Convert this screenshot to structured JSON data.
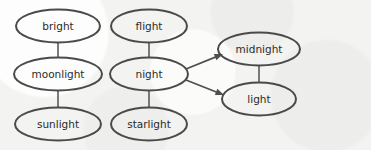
{
  "diagram": {
    "style": {
      "background_color": "#f3f3f1",
      "node_stroke_color": "#4a4a4a",
      "edge_color": "#5a5a5a",
      "arrow_color": "#4f4f4f",
      "label_color": "#2b2b2b"
    },
    "nodes": [
      {
        "id": "bright",
        "label": "bright",
        "cx": 58,
        "cy": 26,
        "rx": 42,
        "ry": 16.5,
        "column": "left"
      },
      {
        "id": "moonlight",
        "label": "moonlight",
        "cx": 58,
        "cy": 74,
        "rx": 44,
        "ry": 16.5,
        "column": "left"
      },
      {
        "id": "sunlight",
        "label": "sunlight",
        "cx": 58,
        "cy": 124,
        "rx": 43,
        "ry": 16.5,
        "column": "left"
      },
      {
        "id": "flight",
        "label": "flight",
        "cx": 149,
        "cy": 26,
        "rx": 38,
        "ry": 16.5,
        "column": "middle"
      },
      {
        "id": "night",
        "label": "night",
        "cx": 149,
        "cy": 74,
        "rx": 39,
        "ry": 16.5,
        "column": "middle"
      },
      {
        "id": "starlight",
        "label": "starlight",
        "cx": 149,
        "cy": 124,
        "rx": 38,
        "ry": 16.5,
        "column": "middle"
      },
      {
        "id": "midnight",
        "label": "midnight",
        "cx": 259,
        "cy": 49,
        "rx": 41,
        "ry": 16.5,
        "column": "right"
      },
      {
        "id": "light",
        "label": "light",
        "cx": 259,
        "cy": 99,
        "rx": 37,
        "ry": 16.5,
        "column": "right"
      }
    ],
    "edges": [
      {
        "id": "bright-moonlight",
        "from": "bright",
        "to": "moonlight",
        "type": "line",
        "x1": 58,
        "y1": 42,
        "x2": 58,
        "y2": 58
      },
      {
        "id": "moonlight-sunlight",
        "from": "moonlight",
        "to": "sunlight",
        "type": "line",
        "x1": 58,
        "y1": 90,
        "x2": 58,
        "y2": 108
      },
      {
        "id": "flight-night",
        "from": "flight",
        "to": "night",
        "type": "line",
        "x1": 149,
        "y1": 42,
        "x2": 149,
        "y2": 58
      },
      {
        "id": "night-starlight",
        "from": "night",
        "to": "starlight",
        "type": "line",
        "x1": 149,
        "y1": 90,
        "x2": 149,
        "y2": 108
      },
      {
        "id": "midnight-light",
        "from": "midnight",
        "to": "light",
        "type": "line",
        "x1": 259,
        "y1": 65,
        "x2": 259,
        "y2": 83
      },
      {
        "id": "night-midnight",
        "from": "night",
        "to": "midnight",
        "type": "arrow",
        "x1": 186,
        "y1": 69,
        "x2": 223,
        "y2": 54
      },
      {
        "id": "night-light",
        "from": "night",
        "to": "light",
        "type": "arrow",
        "x1": 186,
        "y1": 80,
        "x2": 224,
        "y2": 95
      }
    ]
  }
}
